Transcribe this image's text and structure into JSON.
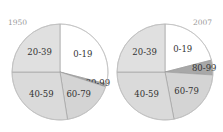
{
  "chart_data": [
    {
      "type": "pie",
      "title": "1950",
      "categories": [
        "0-19",
        "80-99",
        "60-79",
        "40-59",
        "20-39"
      ],
      "values": [
        29,
        1,
        17.5,
        27.5,
        25
      ],
      "colors": [
        "#ffffff",
        "#a8a8a8",
        "#d4d4d4",
        "#dadada",
        "#e0e0e0"
      ],
      "start_angle_deg": 90,
      "direction": "clockwise"
    },
    {
      "type": "pie",
      "title": "2007",
      "categories": [
        "0-19",
        "80-99",
        "60-79",
        "40-59",
        "20-39"
      ],
      "values": [
        21,
        5,
        21,
        28,
        25
      ],
      "colors": [
        "#ffffff",
        "#a8a8a8",
        "#d4d4d4",
        "#dadada",
        "#e0e0e0"
      ],
      "start_angle_deg": 90,
      "direction": "clockwise"
    }
  ]
}
